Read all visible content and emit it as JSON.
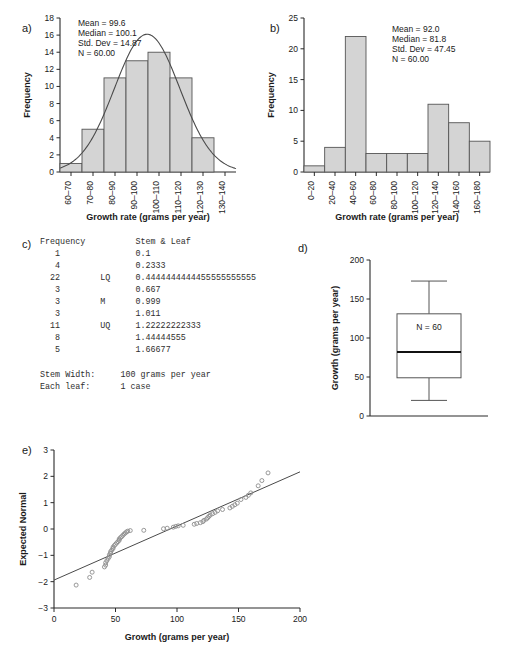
{
  "figure": {
    "panel_labels": {
      "a": "a)",
      "b": "b)",
      "c": "c)",
      "d": "d)",
      "e": "e)"
    }
  },
  "chart_data": [
    {
      "panel": "a)",
      "type": "bar",
      "title": "",
      "xlabel": "Growth rate (grams per year)",
      "ylabel": "Frequency",
      "categories": [
        "60–70",
        "70–80",
        "80–90",
        "90–100",
        "100–110",
        "110–120",
        "120–130",
        "130–140"
      ],
      "values": [
        1,
        5,
        11,
        13,
        14,
        11,
        4,
        0
      ],
      "ylim": [
        0,
        18
      ],
      "yticks": [
        0,
        2,
        4,
        6,
        8,
        10,
        12,
        14,
        16,
        18
      ],
      "grid": false,
      "overlay": {
        "type": "normal-curve",
        "mean": 99.6,
        "sd": 14.87,
        "n": 60,
        "peak": 16.1
      },
      "annotations": [
        "Mean = 99.6",
        "Median = 100.1",
        "Std. Dev = 14.87",
        "N = 60.00"
      ]
    },
    {
      "panel": "b)",
      "type": "bar",
      "title": "",
      "xlabel": "Growth rate (grams per year)",
      "ylabel": "Frequency",
      "categories": [
        "0–20",
        "20–40",
        "40–60",
        "60–80",
        "80–100",
        "100–120",
        "120–140",
        "140–160",
        "160–180"
      ],
      "values": [
        1,
        4,
        22,
        3,
        3,
        3,
        11,
        8,
        5
      ],
      "ylim": [
        0,
        25
      ],
      "yticks": [
        0,
        5,
        10,
        15,
        20,
        25
      ],
      "grid": false,
      "annotations": [
        "Mean = 92.0",
        "Median = 81.8",
        "Std. Dev = 47.45",
        "N = 60.00"
      ]
    },
    {
      "panel": "c)",
      "type": "table",
      "title": "Stem & Leaf",
      "columns": [
        "Frequency",
        "",
        "Stem & Leaf"
      ],
      "rows": [
        [
          "1",
          "",
          "0.1"
        ],
        [
          "4",
          "",
          "0.2333"
        ],
        [
          "22",
          "LQ",
          "0.4444444444455555555555"
        ],
        [
          "3",
          "",
          "0.667"
        ],
        [
          "3",
          "M",
          "0.999"
        ],
        [
          "3",
          "",
          "1.011"
        ],
        [
          "11",
          "UQ",
          "1.22222222333"
        ],
        [
          "8",
          "",
          "1.44444555"
        ],
        [
          "5",
          "",
          "1.66677"
        ]
      ],
      "footer": [
        [
          "Stem Width:",
          "100 grams per year"
        ],
        [
          "Each leaf:",
          "1 case"
        ]
      ]
    },
    {
      "panel": "d)",
      "type": "box",
      "title": "",
      "xlabel": "",
      "ylabel": "Growth (grams per year)",
      "ylim": [
        0,
        200
      ],
      "yticks": [
        0,
        50,
        100,
        150,
        200
      ],
      "grid": false,
      "box": {
        "whisker_low": 20,
        "q1": 49,
        "median": 82,
        "q3": 131,
        "whisker_high": 173
      },
      "annotations": [
        "N = 60"
      ]
    },
    {
      "panel": "e)",
      "type": "scatter",
      "title": "",
      "xlabel": "Growth (grams per year)",
      "ylabel": "Expected Normal",
      "xlim": [
        0,
        200
      ],
      "ylim": [
        -3,
        3
      ],
      "xticks": [
        0,
        50,
        100,
        150,
        200
      ],
      "yticks": [
        -3,
        -2,
        -1,
        0,
        1,
        2,
        3
      ],
      "grid": false,
      "reference_line": {
        "x1": 0,
        "y1": -1.94,
        "x2": 200,
        "y2": 2.17
      },
      "points": [
        [
          18,
          -2.13
        ],
        [
          29,
          -1.84
        ],
        [
          31,
          -1.64
        ],
        [
          41,
          -1.44
        ],
        [
          42,
          -1.37
        ],
        [
          42,
          -1.28
        ],
        [
          43,
          -1.2
        ],
        [
          44,
          -1.12
        ],
        [
          45,
          -1.05
        ],
        [
          45,
          -0.98
        ],
        [
          46,
          -0.92
        ],
        [
          46,
          -0.86
        ],
        [
          47,
          -0.8
        ],
        [
          48,
          -0.74
        ],
        [
          48,
          -0.69
        ],
        [
          49,
          -0.63
        ],
        [
          50,
          -0.58
        ],
        [
          51,
          -0.53
        ],
        [
          52,
          -0.48
        ],
        [
          53,
          -0.43
        ],
        [
          53,
          -0.38
        ],
        [
          54,
          -0.33
        ],
        [
          55,
          -0.29
        ],
        [
          56,
          -0.24
        ],
        [
          57,
          -0.19
        ],
        [
          58,
          -0.15
        ],
        [
          59,
          -0.11
        ],
        [
          60,
          -0.08
        ],
        [
          62,
          -0.06
        ],
        [
          73,
          -0.05
        ],
        [
          89,
          0.01
        ],
        [
          92,
          0.03
        ],
        [
          97,
          0.07
        ],
        [
          99,
          0.1
        ],
        [
          101,
          0.12
        ],
        [
          105,
          0.14
        ],
        [
          114,
          0.18
        ],
        [
          116,
          0.21
        ],
        [
          119,
          0.24
        ],
        [
          121,
          0.28
        ],
        [
          122,
          0.33
        ],
        [
          124,
          0.38
        ],
        [
          125,
          0.43
        ],
        [
          126,
          0.48
        ],
        [
          127,
          0.53
        ],
        [
          129,
          0.58
        ],
        [
          131,
          0.63
        ],
        [
          133,
          0.69
        ],
        [
          137,
          0.74
        ],
        [
          143,
          0.8
        ],
        [
          145,
          0.86
        ],
        [
          147,
          0.92
        ],
        [
          149,
          0.98
        ],
        [
          152,
          1.12
        ],
        [
          156,
          1.2
        ],
        [
          158,
          1.28
        ],
        [
          160,
          1.37
        ],
        [
          166,
          1.64
        ],
        [
          169,
          1.84
        ],
        [
          174,
          2.13
        ]
      ]
    }
  ]
}
